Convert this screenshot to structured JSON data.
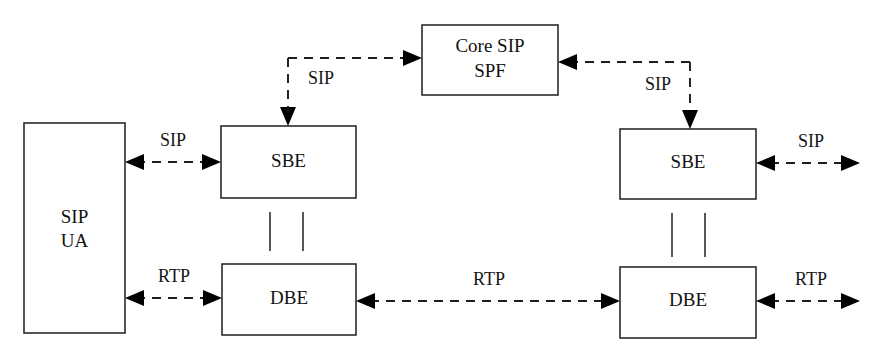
{
  "diagram": {
    "canvas": {
      "width": 880,
      "height": 359
    },
    "background_color": "#ffffff",
    "line_color": "#1d1d1d",
    "box_stroke_color": "#2b2b2b",
    "box_fill_color": "#ffffff",
    "text_color": "#121212",
    "nodes": [
      {
        "id": "sip-ua",
        "label_line1": "SIP",
        "label_line2": "UA",
        "x": 24,
        "y": 123,
        "w": 101,
        "h": 210
      },
      {
        "id": "left-sbe",
        "label_line1": "SBE",
        "label_line2": "",
        "x": 221,
        "y": 126,
        "w": 135,
        "h": 72
      },
      {
        "id": "left-dbe",
        "label_line1": "DBE",
        "label_line2": "",
        "x": 222,
        "y": 264,
        "w": 134,
        "h": 71
      },
      {
        "id": "core-sip-spf",
        "label_line1": "Core SIP",
        "label_line2": "SPF",
        "x": 422,
        "y": 25,
        "w": 136,
        "h": 70
      },
      {
        "id": "right-sbe",
        "label_line1": "SBE",
        "label_line2": "",
        "x": 620,
        "y": 129,
        "w": 136,
        "h": 70
      },
      {
        "id": "right-dbe",
        "label_line1": "DBE",
        "label_line2": "",
        "x": 620,
        "y": 267,
        "w": 136,
        "h": 71
      }
    ],
    "edges": [
      {
        "id": "edge-ua-left-sbe",
        "label": "SIP"
      },
      {
        "id": "edge-ua-left-dbe",
        "label": "RTP"
      },
      {
        "id": "edge-left-sbe-core",
        "label": "SIP"
      },
      {
        "id": "edge-core-right-sbe",
        "label": "SIP"
      },
      {
        "id": "edge-left-dbe-right-dbe",
        "label": "RTP"
      },
      {
        "id": "edge-right-sbe-out",
        "label": "SIP"
      },
      {
        "id": "edge-right-dbe-out",
        "label": "RTP"
      }
    ]
  }
}
